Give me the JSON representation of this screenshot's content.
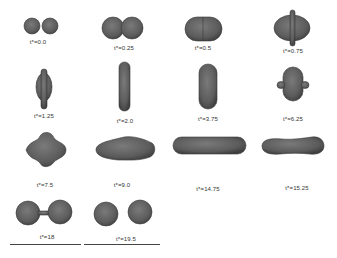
{
  "figure": {
    "fill_color": "#5f5f5f",
    "edge_color": "#3a3a3a",
    "highlight_color": "#7a7a7a",
    "frames": [
      {
        "label": "t*=0.0",
        "shape": "two-separate-spheres"
      },
      {
        "label": "t*=0.25",
        "shape": "two-touching-spheres"
      },
      {
        "label": "t*=0.5",
        "shape": "merged-oblong-horizontal"
      },
      {
        "label": "t*=0.75",
        "shape": "oblate-with-rim"
      },
      {
        "label": "t*=1.25",
        "shape": "vertical-disc-with-rim"
      },
      {
        "label": "t*=2.0",
        "shape": "vertical-cylinder-thin"
      },
      {
        "label": "t*=3.75",
        "shape": "vertical-cylinder-thick"
      },
      {
        "label": "t*=6.25",
        "shape": "squat-with-side-lobes"
      },
      {
        "label": "t*=7.5",
        "shape": "diamond-horizontal"
      },
      {
        "label": "t*=9.0",
        "shape": "elongated-horizontal-spindle"
      },
      {
        "label": "t*=14.75",
        "shape": "long-horizontal-cylinder"
      },
      {
        "label": "t*=15.25",
        "shape": "dumbbell-horizontal"
      },
      {
        "label": "t*=18",
        "shape": "two-spheres-pinching"
      },
      {
        "label": "t*=19.5",
        "shape": "two-separated-spheres-final"
      }
    ]
  }
}
